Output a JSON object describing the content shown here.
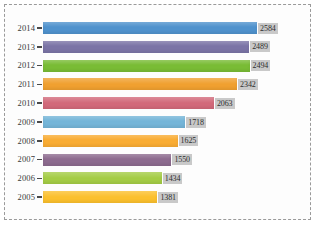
{
  "chart_data": {
    "type": "bar",
    "orientation": "horizontal",
    "title": "",
    "subtitle": "",
    "xlabel": "",
    "ylabel": "",
    "grid": false,
    "legend": "none",
    "xlim": [
      0,
      2800
    ],
    "categories": [
      "2014",
      "2013",
      "2012",
      "2011",
      "2010",
      "2009",
      "2008",
      "2007",
      "2006",
      "2005"
    ],
    "values": [
      2584,
      2489,
      2494,
      2342,
      2063,
      1718,
      1625,
      1550,
      1434,
      1381
    ],
    "value_labels": [
      "2584",
      "2489",
      "2494",
      "2342",
      "2063",
      "1718",
      "1625",
      "1550",
      "1434",
      "1381"
    ],
    "bar_colors": [
      "#4f92cd",
      "#7b74a6",
      "#79bc35",
      "#f0a030",
      "#d2697a",
      "#74b5d8",
      "#f9ac33",
      "#8d6b8f",
      "#a4cc45",
      "#fbc02d"
    ],
    "series": [
      {
        "name": "count",
        "values": [
          2584,
          2489,
          2494,
          2342,
          2063,
          1718,
          1625,
          1550,
          1434,
          1381
        ]
      }
    ]
  },
  "style": {
    "frame_border_color": "#9a9a9a",
    "label_background": "#c9c9c9",
    "background": "#fdfdfd"
  }
}
